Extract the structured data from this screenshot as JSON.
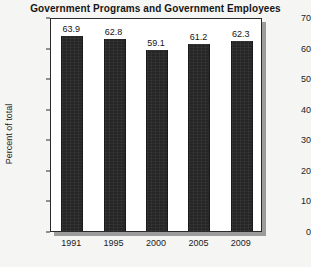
{
  "chart_data": {
    "type": "bar",
    "title": "Government Programs and Government Employees",
    "xlabel": "",
    "ylabel": "Percent of total",
    "categories": [
      "1991",
      "1995",
      "2000",
      "2005",
      "2009"
    ],
    "values": [
      63.9,
      62.8,
      59.1,
      61.2,
      62.3
    ],
    "value_labels": [
      "63.9",
      "62.8",
      "59.1",
      "61.2",
      "62.3"
    ],
    "ylim": [
      0,
      70
    ],
    "yticks": [
      0,
      10,
      20,
      30,
      40,
      50,
      60,
      70
    ],
    "ytick_labels": [
      "0",
      "10",
      "20",
      "30",
      "40",
      "50",
      "60",
      "70"
    ],
    "grid": false,
    "legend": false,
    "bar_color": "#262626",
    "plot_background": "#ffffff",
    "figure_background": "#f5f5f3"
  }
}
